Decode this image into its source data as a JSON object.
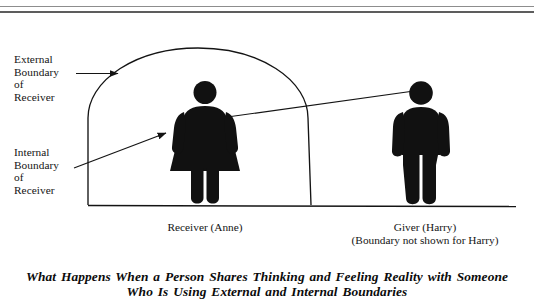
{
  "figure": {
    "background_color": "#ffffff",
    "ink_color": "#141414",
    "top_rule": {
      "name": "double-horizontal-rule"
    },
    "callouts": [
      {
        "id": "external-boundary",
        "lines": [
          "External",
          "Boundary",
          "of",
          "Receiver"
        ],
        "arrow": "horizontal-arrow-right"
      },
      {
        "id": "internal-boundary",
        "lines": [
          "Internal",
          "Boundary",
          "of",
          "Receiver"
        ],
        "arrow": "diagonal-arrow-up-right"
      }
    ],
    "figures": [
      {
        "id": "receiver",
        "pictogram": "female-figure",
        "caption_lines": [
          "Receiver (Anne)"
        ]
      },
      {
        "id": "giver",
        "pictogram": "male-figure",
        "caption_lines": [
          "Giver (Harry)",
          "(Boundary not shown for Harry)"
        ]
      }
    ],
    "title_lines": [
      "What Happens When a Person Shares Thinking and Feeling Reality with Someone",
      "Who Is Using External and Internal Boundaries"
    ]
  }
}
